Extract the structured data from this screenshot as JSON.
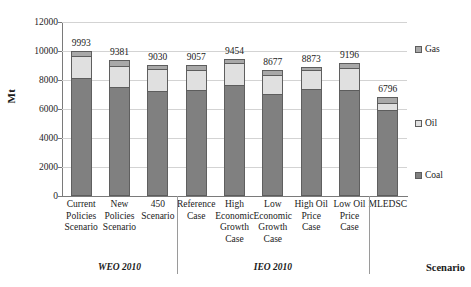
{
  "chart_data": {
    "type": "bar",
    "subtype": "stacked-column",
    "title": "",
    "xlabel": "Scenario",
    "ylabel": "Mt",
    "ylim": [
      0,
      12000
    ],
    "ytick_labels": [
      "0",
      "2000",
      "4000",
      "6000",
      "8000",
      "10000",
      "12000"
    ],
    "ytick_values": [
      0,
      2000,
      4000,
      6000,
      8000,
      10000,
      12000
    ],
    "grid": true,
    "legend_position": "right",
    "categories": [
      "Current Policies Scenario",
      "New Policies Scenario",
      "450 Scenario",
      "Reference Case",
      "High Economic Growth Case",
      "Low Economic Growth Case",
      "High Oil Price Case",
      "Low Oil Price Case",
      "MLEDSC"
    ],
    "series": [
      {
        "name": "Coal",
        "color": "#808080",
        "values": [
          8160,
          7540,
          7250,
          7330,
          7680,
          7020,
          7400,
          7320,
          5910
        ]
      },
      {
        "name": "Oil",
        "color": "#e0e0e0",
        "values": [
          1480,
          1405,
          1500,
          1370,
          1480,
          1345,
          1265,
          1525,
          500
        ]
      },
      {
        "name": "Gas",
        "color": "#a8a8a8",
        "values": [
          353,
          436,
          280,
          357,
          294,
          312,
          208,
          351,
          386
        ]
      }
    ],
    "data_labels": [
      9993,
      9381,
      9030,
      9057,
      9454,
      8677,
      8873,
      9196,
      6796
    ],
    "groups": [
      {
        "label": "WEO 2010",
        "categories": [
          "Current Policies Scenario",
          "New Policies Scenario",
          "450 Scenario"
        ]
      },
      {
        "label": "IEO 2010",
        "categories": [
          "Reference Case",
          "High Economic Growth Case",
          "Low Economic Growth Case",
          "High Oil Price Case",
          "Low Oil Price Case"
        ]
      },
      {
        "label": "",
        "categories": [
          "MLEDSC"
        ]
      }
    ]
  },
  "axis": {
    "y_title": "Mt",
    "x_title": "Scenario"
  },
  "legend": {
    "items": [
      {
        "label": "Gas",
        "color": "#a8a8a8"
      },
      {
        "label": "Oil",
        "color": "#e0e0e0"
      },
      {
        "label": "Coal",
        "color": "#808080"
      }
    ]
  },
  "category_label_lines": [
    [
      "Current",
      "Policies",
      "Scenario"
    ],
    [
      "New",
      "Policies",
      "Scenario"
    ],
    [
      "450",
      "Scenario"
    ],
    [
      "Reference",
      "Case"
    ],
    [
      "High",
      "Economic",
      "Growth",
      "Case"
    ],
    [
      "Low",
      "Economic",
      "Growth",
      "Case"
    ],
    [
      "High Oil",
      "Price",
      "Case"
    ],
    [
      "Low Oil",
      "Price",
      "Case"
    ],
    [
      "MLEDSC"
    ]
  ],
  "group_labels": [
    "WEO 2010",
    "IEO 2010"
  ]
}
